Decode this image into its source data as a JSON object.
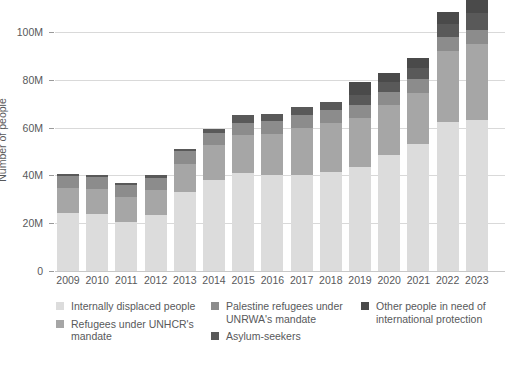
{
  "chart_data": {
    "type": "bar",
    "stacked": true,
    "title": "",
    "xlabel": "",
    "ylabel": "Number of people",
    "ylim": [
      0,
      110
    ],
    "yticks": [
      0,
      20,
      40,
      60,
      80,
      100
    ],
    "ytick_labels": [
      "0",
      "20M",
      "40M",
      "60M",
      "80M",
      "100M"
    ],
    "unit": "millions of people",
    "grid": true,
    "legend_position": "bottom",
    "categories": [
      "2009",
      "2010",
      "2011",
      "2012",
      "2013",
      "2014",
      "2015",
      "2016",
      "2017",
      "2018",
      "2019",
      "2020",
      "2021",
      "2022",
      "2023"
    ],
    "series": [
      {
        "name": "Internally displaced people",
        "color": "#dcdcdc",
        "values": [
          24.4,
          24.0,
          20.6,
          23.5,
          33.1,
          38.2,
          40.8,
          40.3,
          40.0,
          41.4,
          43.5,
          48.6,
          53.2,
          62.5,
          63.3
        ]
      },
      {
        "name": "Refugees under UNHCR's mandate",
        "color": "#a6a6a6",
        "values": [
          10.4,
          10.5,
          10.4,
          10.5,
          11.7,
          14.4,
          16.1,
          17.2,
          19.9,
          20.4,
          20.4,
          20.7,
          21.3,
          29.4,
          31.6
        ]
      },
      {
        "name": "Palestine refugees under UNRWA's mandate",
        "color": "#8c8c8c",
        "values": [
          4.8,
          4.8,
          5.0,
          5.1,
          5.2,
          5.1,
          5.2,
          5.3,
          5.4,
          5.5,
          5.6,
          5.7,
          5.8,
          5.9,
          6.0
        ]
      },
      {
        "name": "Asylum-seekers",
        "color": "#595959",
        "values": [
          1.0,
          0.8,
          0.9,
          0.9,
          1.2,
          1.8,
          3.2,
          2.7,
          3.1,
          3.5,
          4.2,
          4.1,
          4.6,
          5.4,
          6.9
        ]
      },
      {
        "name": "Other people in need of international protection",
        "color": "#4a4a4a",
        "values": [
          0.0,
          0.0,
          0.0,
          0.0,
          0.0,
          0.0,
          0.0,
          0.0,
          0.0,
          0.0,
          5.2,
          3.6,
          4.4,
          5.2,
          5.8
        ]
      }
    ],
    "totals": [
      40.6,
      40.1,
      36.9,
      40.0,
      51.2,
      59.5,
      65.3,
      65.5,
      68.4,
      70.8,
      78.9,
      82.7,
      89.3,
      108.4,
      113.6
    ]
  },
  "axis": {
    "y_title": "Number of people",
    "y_tick_labels": [
      "100M",
      "80M",
      "60M",
      "40M",
      "20M",
      "0"
    ],
    "x_tick_labels": [
      "2009",
      "2010",
      "2011",
      "2012",
      "2013",
      "2014",
      "2015",
      "2016",
      "2017",
      "2018",
      "2019",
      "2020",
      "2021",
      "2022",
      "2023"
    ]
  },
  "legend": {
    "columns": [
      [
        {
          "label": "Internally displaced people",
          "color": "#dcdcdc",
          "swatch_name": "legend-swatch-internally-displaced"
        },
        {
          "label": "Refugees under UNHCR's mandate",
          "color": "#a6a6a6",
          "swatch_name": "legend-swatch-refugees-unhcr"
        }
      ],
      [
        {
          "label": "Palestine refugees under UNRWA's mandate",
          "color": "#8c8c8c",
          "swatch_name": "legend-swatch-palestine-unrwa"
        },
        {
          "label": "Asylum-seekers",
          "color": "#595959",
          "swatch_name": "legend-swatch-asylum-seekers"
        }
      ],
      [
        {
          "label": "Other people in need of international protection",
          "color": "#4a4a4a",
          "swatch_name": "legend-swatch-other-protection"
        }
      ]
    ]
  },
  "colors": {
    "background": "#ffffff",
    "text": "#58595b",
    "gridline": "#d9d9d9",
    "axis": "#9a9a9a"
  }
}
